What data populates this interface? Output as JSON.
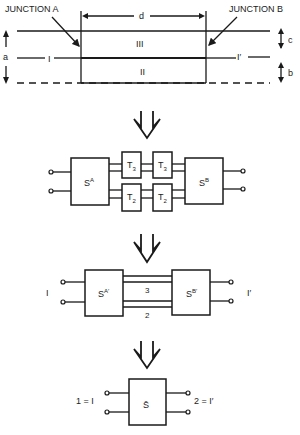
{
  "stage1": {
    "junction_a": "JUNCTION A",
    "junction_b": "JUNCTION B",
    "dim_d": "d",
    "dim_a": "a",
    "dim_b": "b",
    "dim_c": "c",
    "region_iii": "III",
    "region_ii": "II",
    "port_left": "I",
    "port_right": "I′"
  },
  "stage2": {
    "block_a": "S",
    "block_a_sup": "A",
    "block_b": "S",
    "block_b_sup": "B",
    "t_upper_1": "T",
    "t_upper_1_sub": "3",
    "t_upper_2": "T",
    "t_upper_2_sub": "3",
    "t_lower_1": "T",
    "t_lower_1_sub": "2",
    "t_lower_2": "T",
    "t_lower_2_sub": "2"
  },
  "stage3": {
    "block_a": "S",
    "block_a_sup": "A′",
    "block_b": "S",
    "block_b_sup": "B′",
    "line_upper": "3",
    "line_lower": "2",
    "port_left": "I",
    "port_right": "I′"
  },
  "stage4": {
    "block": "S̄",
    "port_left": "1 = I",
    "port_right": "2 = I′"
  }
}
